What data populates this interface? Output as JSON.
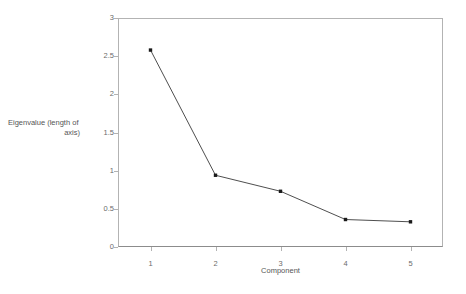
{
  "chart_data": {
    "type": "line",
    "title": "",
    "subtitle": "",
    "xlabel": "Component",
    "ylabel": "Eigenvalue (length of axis)",
    "ylabel_line1": "Eigenvalue (length of",
    "ylabel_line2": "axis)",
    "categories": [
      "1",
      "2",
      "3",
      "4",
      "5"
    ],
    "x": [
      1,
      2,
      3,
      4,
      5
    ],
    "values": [
      2.58,
      0.94,
      0.73,
      0.36,
      0.33
    ],
    "series": [
      {
        "name": "Eigenvalue",
        "values": [
          2.58,
          0.94,
          0.73,
          0.36,
          0.33
        ]
      }
    ],
    "xlim": [
      0.5,
      5.5
    ],
    "ylim": [
      0,
      3
    ],
    "y_ticks": [
      0,
      0.5,
      1,
      1.5,
      2,
      2.5,
      3
    ],
    "y_tick_labels": [
      "0",
      "0.5",
      "1",
      "1.5",
      "2",
      "2.5",
      "3"
    ],
    "x_ticks": [
      1,
      2,
      3,
      4,
      5
    ],
    "x_tick_labels": [
      "1",
      "2",
      "3",
      "4",
      "5"
    ],
    "grid": false,
    "legend": false,
    "legend_position": "none",
    "marker": "square",
    "line_color": "#3a3a3a",
    "marker_color": "#1a1a1a",
    "axis_color": "#b3b3b3",
    "text_color": "#5a5a5a",
    "background_color": "#ffffff",
    "annotations": []
  }
}
